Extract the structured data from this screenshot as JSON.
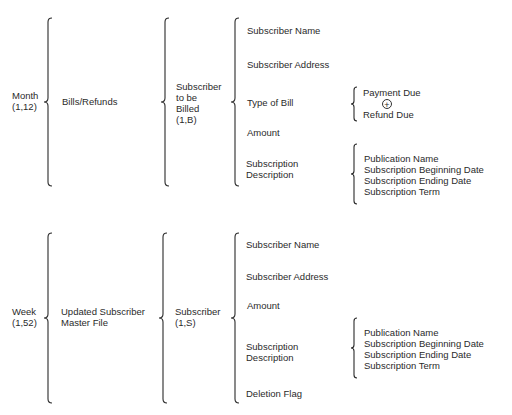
{
  "diagram": {
    "type": "warnier-orr",
    "sections": [
      {
        "root": {
          "label": "Month",
          "repeat": "(1,12)"
        },
        "level1": "Bills/Refunds",
        "level2": {
          "lines": [
            "Subscriber",
            "to be",
            "Billed",
            "(1,B)"
          ]
        },
        "fields": [
          {
            "label": "Subscriber Name"
          },
          {
            "label": "Subscriber Address"
          },
          {
            "label": "Type of Bill",
            "options": [
              "Payment Due",
              "Refund Due"
            ],
            "operator": "+"
          },
          {
            "label": "Amount"
          },
          {
            "label_lines": [
              "Subscription",
              "Description"
            ],
            "children": [
              "Publication Name",
              "Subscription Beginning Date",
              "Subscription Ending Date",
              "Subscription Term"
            ]
          }
        ]
      },
      {
        "root": {
          "label": "Week",
          "repeat": "(1,52)"
        },
        "level1_lines": [
          "Updated Subscriber",
          "Master File"
        ],
        "level2": {
          "lines": [
            "Subscriber",
            "(1,S)"
          ]
        },
        "fields": [
          {
            "label": "Subscriber Name"
          },
          {
            "label": "Subscriber Address"
          },
          {
            "label": "Amount"
          },
          {
            "label_lines": [
              "Subscription",
              "Description"
            ],
            "children": [
              "Publication Name",
              "Subscription Beginning Date",
              "Subscription Ending Date",
              "Subscription Term"
            ]
          },
          {
            "label": "Deletion Flag"
          }
        ]
      }
    ]
  }
}
